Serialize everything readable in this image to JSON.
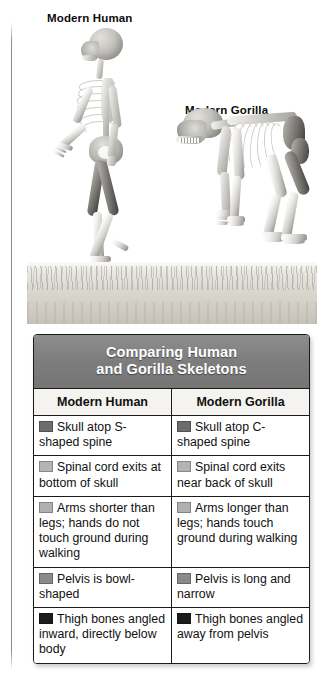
{
  "figure": {
    "human_label": "Modern Human",
    "gorilla_label": "Modern Gorilla"
  },
  "table": {
    "title": "Comparing Human\nand Gorilla Skeletons",
    "title_line1": "Comparing Human",
    "title_line2": "and Gorilla Skeletons",
    "columns": [
      "Modern Human",
      "Modern Gorilla"
    ],
    "rows": [
      {
        "swatch": "#6d6d6d",
        "human": "Skull atop S-shaped spine",
        "gorilla": "Skull atop C-shaped spine"
      },
      {
        "swatch": "#b4b4b4",
        "human": "Spinal cord exits at bottom of skull",
        "gorilla": "Spinal cord exits near back of skull"
      },
      {
        "swatch": "#b0b0b0",
        "human": "Arms shorter than legs; hands do not touch ground during walking",
        "gorilla": "Arms longer than legs; hands touch ground during walking"
      },
      {
        "swatch": "#8a8a8a",
        "human": "Pelvis is bowl-shaped",
        "gorilla": "Pelvis is long and narrow"
      },
      {
        "swatch": "#1c1c1c",
        "human": "Thigh bones angled inward, directly below body",
        "gorilla": "Thigh bones angled away from pelvis"
      }
    ]
  },
  "colors": {
    "title_band": "#7d7d7d",
    "header_row": "#f4f3ef",
    "border": "#1a1a1a",
    "ground": "#d5d2ca"
  }
}
